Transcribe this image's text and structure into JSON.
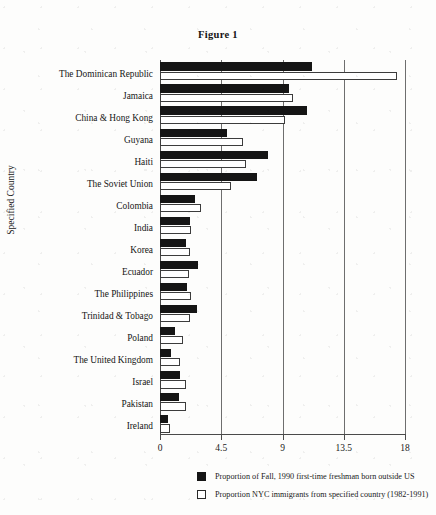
{
  "figure": {
    "title": "Figure 1",
    "ylabel": "Specified Country"
  },
  "legend": {
    "items": [
      {
        "swatch": "dark-square-swatch",
        "label": "Proportion of Fall, 1990 first-time freshman born outside US"
      },
      {
        "swatch": "open-square-swatch",
        "label": "Proportion NYC immigrants from specified country (1982-1991)"
      }
    ]
  },
  "axis": {
    "x_ticks": [
      "0",
      "4.5",
      "9",
      "13.5",
      "18"
    ],
    "x_tick_values": [
      0,
      4.5,
      9,
      13.5,
      18
    ]
  },
  "chart_data": {
    "type": "bar",
    "orientation": "horizontal",
    "title": "Figure 1",
    "xlabel": "",
    "ylabel": "Specified Country",
    "xlim": [
      0,
      18
    ],
    "xticks": [
      0,
      4.5,
      9,
      13.5,
      18
    ],
    "grid": true,
    "legend_position": "bottom",
    "categories": [
      "The Dominican Republic",
      "Jamaica",
      "China & Hong Kong",
      "Guyana",
      "Haiti",
      "The Soviet Union",
      "Colombia",
      "India",
      "Korea",
      "Ecuador",
      "The Philippines",
      "Trinidad & Tobago",
      "Poland",
      "The United Kingdom",
      "Israel",
      "Pakistan",
      "Ireland"
    ],
    "series": [
      {
        "name": "Proportion of Fall, 1990 first-time freshman born outside US",
        "color": "#151515",
        "values": [
          11.2,
          9.5,
          10.8,
          4.9,
          7.9,
          7.1,
          2.6,
          2.2,
          1.9,
          2.8,
          2.0,
          2.7,
          1.1,
          0.8,
          1.5,
          1.4,
          0.6
        ]
      },
      {
        "name": "Proportion NYC immigrants from specified country (1982-1991)",
        "color": "#ffffff",
        "values": [
          17.4,
          9.8,
          9.2,
          6.1,
          6.3,
          5.2,
          3.0,
          2.3,
          2.2,
          2.1,
          2.3,
          2.2,
          1.7,
          1.5,
          1.9,
          1.9,
          0.7
        ]
      }
    ]
  }
}
